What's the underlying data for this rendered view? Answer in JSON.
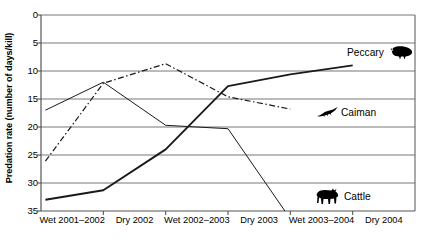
{
  "chart_data": {
    "type": "line",
    "title": "",
    "xlabel": "",
    "ylabel": "Predation rate (number of days/kill)",
    "categories": [
      "Wet 2001–2002",
      "Dry 2002",
      "Wet 2002–2003",
      "Dry 2003",
      "Wet 2003–2004",
      "Dry 2004"
    ],
    "yticks": [
      0,
      5,
      10,
      15,
      20,
      25,
      30,
      35
    ],
    "ylim": [
      0,
      35
    ],
    "y_axis_inverted": true,
    "grid": "horizontal",
    "legend_position": "inline-right-annotations",
    "series": [
      {
        "name": "Peccary",
        "icon": "peccary-silhouette-icon",
        "line_style": "solid-thick",
        "values": [
          33.0,
          31.3,
          24.0,
          12.7,
          10.6,
          9.0
        ]
      },
      {
        "name": "Caiman",
        "icon": "caiman-silhouette-icon",
        "line_style": "dash-dot",
        "values": [
          26.1,
          12.2,
          8.7,
          14.6,
          16.8,
          null
        ]
      },
      {
        "name": "Cattle",
        "icon": "cattle-silhouette-icon",
        "line_style": "solid-thin",
        "values": [
          17.0,
          12.0,
          19.7,
          20.3,
          36.4,
          null
        ],
        "note": "drops below axis after Dry 2003"
      }
    ]
  },
  "geometry": {
    "plot_left": 41,
    "plot_right": 415,
    "plot_top": 15,
    "plot_bottom": 211
  },
  "colors": {
    "axis": "#555555",
    "grid": "#777777",
    "series_line": "#1a1a1a",
    "background": "#ffffff"
  }
}
